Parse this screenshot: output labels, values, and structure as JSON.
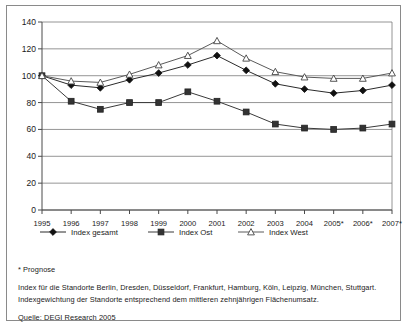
{
  "chart_data": {
    "type": "line",
    "title": "",
    "xlabel": "",
    "ylabel": "",
    "ylim": [
      0,
      140
    ],
    "ytick_step": 20,
    "yticks": [
      0,
      20,
      40,
      60,
      80,
      100,
      120,
      140
    ],
    "grid": true,
    "legend_position": "bottom-left",
    "categories": [
      "1995",
      "1996",
      "1997",
      "1998",
      "1999",
      "2000",
      "2001",
      "2002",
      "2003",
      "2004",
      "2005*",
      "2006*",
      "2007*"
    ],
    "series": [
      {
        "name": "Index gesamt",
        "marker": "filled-diamond",
        "values": [
          100,
          93,
          91,
          97,
          102,
          108,
          115,
          104,
          94,
          90,
          87,
          89,
          93
        ]
      },
      {
        "name": "Index Ost",
        "marker": "filled-square",
        "values": [
          100,
          81,
          75,
          80,
          80,
          88,
          81,
          73,
          64,
          61,
          60,
          61,
          64
        ]
      },
      {
        "name": "Index West",
        "marker": "open-triangle",
        "values": [
          100,
          96,
          95,
          101,
          108,
          115,
          126,
          113,
          103,
          99,
          98,
          98,
          102
        ]
      }
    ]
  },
  "legend": {
    "items": [
      {
        "label": "Index gesamt"
      },
      {
        "label": "Index Ost"
      },
      {
        "label": "Index West"
      }
    ]
  },
  "notes": {
    "footnote_prognose": "* Prognose",
    "line_standorte": "Index für die Standorte Berlin, Dresden, Düsseldorf, Frankfurt, Hamburg, Köln, Leipzig, München, Stuttgart.",
    "line_gewichtung": "Indexgewichtung der Standorte entsprechend dem mittleren zehnjährigen Flächenumsatz.",
    "source": "Quelle: DEGI Research 2005"
  },
  "colors": {
    "frame": "#8a8a8a",
    "grid": "#7a7a7a",
    "axis": "#4a4a4a",
    "line_gesamt": "#2b2b2b",
    "line_ost": "#3a3a3a",
    "line_west": "#5a5a5a",
    "text": "#1a1a1a",
    "background": "#ffffff"
  }
}
